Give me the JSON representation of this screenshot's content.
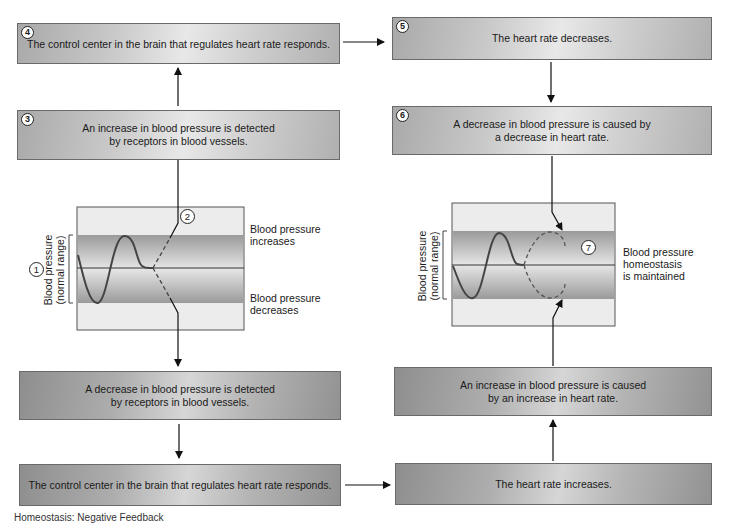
{
  "diagram": {
    "boxes": {
      "step4": {
        "number": "4",
        "text": "The control center in the brain that regulates heart rate responds."
      },
      "step5": {
        "number": "5",
        "text": "The heart rate decreases."
      },
      "step3": {
        "number": "3",
        "text": "An increase in blood pressure is detected\nby receptors in blood vessels."
      },
      "step6": {
        "number": "6",
        "text": "A decrease in blood pressure is caused by\na decrease in heart rate."
      },
      "decrease_detected": {
        "text": "A decrease in blood pressure is detected\nby receptors in blood vessels."
      },
      "increase_caused": {
        "text": "An increase in blood pressure is caused\nby an increase in heart rate."
      },
      "control_center_bottom": {
        "text": "The control center in the brain that regulates heart rate responds."
      },
      "heart_rate_increases": {
        "text": "The heart rate increases."
      }
    },
    "left_graph": {
      "step1_number": "1",
      "step2_number": "2",
      "y_axis_label": "Blood pressure\n(normal range)",
      "label_increases": "Blood pressure\nincreases",
      "label_decreases": "Blood pressure\ndecreases"
    },
    "right_graph": {
      "step7_number": "7",
      "y_axis_label": "Blood pressure\n(normal range)",
      "label_maintained": "Blood pressure\nhomeostasis\nis maintained"
    },
    "caption_partial": "Homeostasis: Negative Feedback"
  }
}
